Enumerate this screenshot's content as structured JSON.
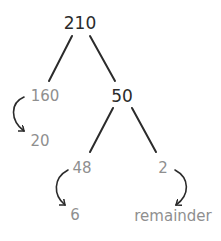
{
  "diagram": {
    "type": "number-bond-tree",
    "colors": {
      "primary": "#2b2b2b",
      "secondary": "#8f8f8f",
      "line": "#2b2b2b"
    },
    "nodes": {
      "root": {
        "label": "210"
      },
      "left_part": {
        "label": "160"
      },
      "left_result": {
        "label": "20"
      },
      "right_part": {
        "label": "50"
      },
      "right_left_part": {
        "label": "48"
      },
      "right_left_result": {
        "label": "6"
      },
      "right_right_part": {
        "label": "2"
      },
      "right_right_result": {
        "label": "remainder"
      }
    },
    "edges": [
      {
        "from": "210",
        "to": "160",
        "style": "line"
      },
      {
        "from": "210",
        "to": "50",
        "style": "line"
      },
      {
        "from": "50",
        "to": "48",
        "style": "line"
      },
      {
        "from": "50",
        "to": "2",
        "style": "line"
      },
      {
        "from": "160",
        "to": "20",
        "style": "curved-arrow"
      },
      {
        "from": "48",
        "to": "6",
        "style": "curved-arrow"
      },
      {
        "from": "2",
        "to": "remainder",
        "style": "curved-arrow"
      }
    ]
  }
}
